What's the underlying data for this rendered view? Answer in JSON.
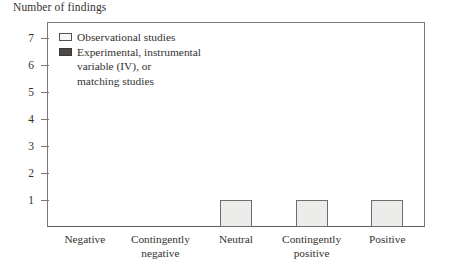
{
  "chart_data": {
    "type": "bar",
    "title": "Number of findings",
    "xlabel": "",
    "ylabel": "Number of findings",
    "categories": [
      "Negative",
      "Contingently negative",
      "Neutral",
      "Contingently positive",
      "Positive"
    ],
    "category_labels_wrapped": [
      "Negative",
      "Contingently\nnegative",
      "Neutral",
      "Contingently\npositive",
      "Positive"
    ],
    "series": [
      {
        "name": "Observational studies",
        "values": [
          0,
          0,
          1,
          1,
          1
        ],
        "color": "#ececeb",
        "border_color": "#6f6d6c"
      },
      {
        "name": "Experimental, instrumental variable (IV), or matching studies",
        "values": [
          0,
          0,
          0,
          0,
          0
        ],
        "color": "#4b4a48",
        "border_color": "#3a3937"
      }
    ],
    "ylim": [
      0,
      7.6
    ],
    "yticks": [
      1,
      2,
      3,
      4,
      5,
      6,
      7
    ],
    "ytick_labels": [
      "1",
      "2",
      "3",
      "4",
      "5",
      "6",
      "7"
    ],
    "grid": false,
    "legend_position": "top-left-inside",
    "legend": [
      {
        "label": "Observational studies",
        "swatch": "light-square-swatch"
      },
      {
        "label": "Experimental, instrumental\nvariable (IV), or\nmatching studies",
        "swatch": "dark-square-swatch"
      }
    ]
  }
}
